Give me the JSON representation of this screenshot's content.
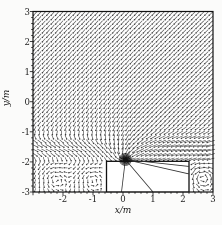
{
  "figure": {
    "xlabel": "x/m",
    "ylabel": "y/m"
  },
  "chart_data": {
    "type": "quiver",
    "title": "",
    "xlabel": "x/m",
    "ylabel": "y/m",
    "xlim": [
      -3,
      3
    ],
    "ylim": [
      -3,
      3
    ],
    "grid": false,
    "legend": "none",
    "xtick_values": [
      -2,
      -1,
      0,
      1,
      2,
      3
    ],
    "xtick_labels": [
      "-2",
      "-1",
      "0",
      "1",
      "2",
      "3"
    ],
    "ytick_values": [
      3,
      2,
      1,
      0,
      -1,
      -2,
      -3
    ],
    "ytick_labels": [
      "3",
      "2",
      "1",
      "0",
      "-1",
      "-2",
      "-3"
    ],
    "minor_tick_step": 0.2,
    "colors": {
      "arrow": "#2a2a2a",
      "frame": "#111111",
      "background": "#ffffff",
      "line": "#333333"
    },
    "field": {
      "grid": {
        "x0": -2.93,
        "x1": 2.93,
        "y0": -2.93,
        "y1": 2.93,
        "nx": 41,
        "ny": 41
      },
      "uniform": {
        "ux": -0.55,
        "uy": -0.5
      },
      "band": {
        "yc": -1.55,
        "halfwidth": 0.42,
        "amp": 1.5,
        "xscale": 1.4
      },
      "sink": {
        "x": 0.08,
        "y": -1.92,
        "strength": 0.45,
        "burst_rays": 36
      },
      "vortices": [
        {
          "x": 2.62,
          "y": -2.5,
          "strength": 1.1,
          "radius": 0.38
        },
        {
          "x": -2.35,
          "y": -2.5,
          "strength": 0.45,
          "radius": 0.5
        },
        {
          "x": -1.1,
          "y": -2.55,
          "strength": 0.4,
          "radius": 0.45
        }
      ],
      "ground_level": -2.05,
      "ground_damping": {
        "uniform": 0.35,
        "sink": 0.3
      }
    },
    "obstacle_rect": {
      "x0": -0.55,
      "x1": 2.2,
      "y0": -3.0,
      "y1": -1.98
    },
    "field_lines": [
      {
        "from": [
          0.08,
          -1.92
        ],
        "to": [
          -0.05,
          -3.0
        ]
      },
      {
        "from": [
          0.08,
          -1.92
        ],
        "to": [
          1.0,
          -3.0
        ]
      },
      {
        "from": [
          0.08,
          -1.92
        ],
        "to": [
          2.2,
          -2.4
        ]
      },
      {
        "from": [
          0.08,
          -1.92
        ],
        "to": [
          2.2,
          -2.15
        ]
      }
    ]
  }
}
